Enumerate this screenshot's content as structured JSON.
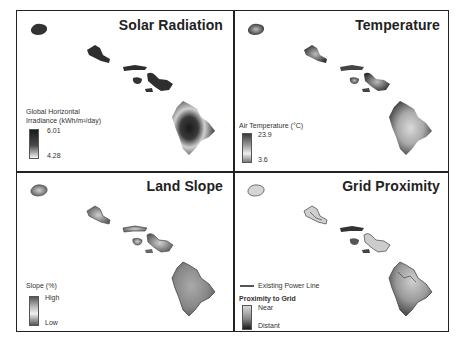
{
  "panels": [
    {
      "id": "solar",
      "title": "Solar Radiation",
      "legend": {
        "title_line1": "Global Horizontal",
        "title_line2": "Irradiance (kWh/m²/day)",
        "max_label": "6.01",
        "min_label": "4.28",
        "gradient": [
          "#1a1a1a",
          "#444444",
          "#f2f2f2"
        ]
      }
    },
    {
      "id": "temperature",
      "title": "Temperature",
      "legend": {
        "title_line1": "Air Temperature  (°C)",
        "max_label": "23.9",
        "min_label": "3.6",
        "gradient": [
          "#3a3a3a",
          "#9a9a9a",
          "#eeeeee",
          "#7a7a7a"
        ]
      }
    },
    {
      "id": "slope",
      "title": "Land Slope",
      "legend": {
        "title_line1": "Slope (%)",
        "max_label": "High",
        "min_label": "Low",
        "gradient": [
          "#555555",
          "#bbbbbb",
          "#f0f0f0",
          "#555555"
        ]
      }
    },
    {
      "id": "grid",
      "title": "Grid Proximity",
      "legend": {
        "line_label": "Existing Power Line",
        "title_line1": "Proximity to Grid",
        "max_label": "Near",
        "min_label": "Distant",
        "gradient": [
          "#d8d8d8",
          "#888888",
          "#1a1a1a"
        ]
      }
    }
  ]
}
